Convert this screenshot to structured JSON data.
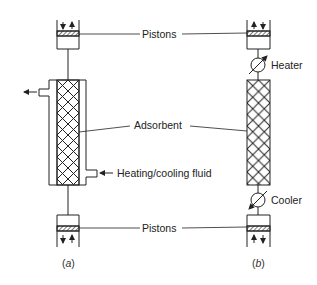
{
  "diagram": {
    "labels": {
      "pistons_top": "Pistons",
      "pistons_bottom": "Pistons",
      "heater": "Heater",
      "cooler": "Cooler",
      "adsorbent": "Adsorbent",
      "fluid": "Heating/cooling fluid"
    },
    "captions": {
      "a_open": "(",
      "a_letter": "a",
      "a_close": ")",
      "b_open": "(",
      "b_letter": "b",
      "b_close": ")"
    },
    "colors": {
      "line": "#222222",
      "background": "#ffffff"
    }
  }
}
